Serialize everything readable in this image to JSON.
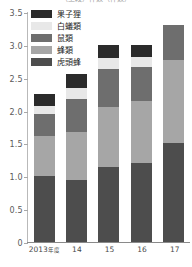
{
  "chart_data": {
    "type": "bar",
    "subtype": "stacked-vertical",
    "title": "（上段）件数（件数）",
    "title_clipped": true,
    "xlabel": "",
    "ylabel": "",
    "categories": [
      "2013年度",
      "14",
      "15",
      "16",
      "17"
    ],
    "ylim": [
      0,
      3.5
    ],
    "ytick_values": [
      0,
      0.5,
      1.0,
      1.5,
      2.0,
      2.5,
      3.0,
      3.5
    ],
    "ytick_labels": [
      "0",
      "0.5",
      "1.0",
      "1.5",
      "2.0",
      "2.5",
      "3.0",
      "3.5"
    ],
    "grid": false,
    "legend_position": "top-left",
    "stack_order_bottom_to_top": [
      "虎頭蜂",
      "蜂類",
      "鼠類",
      "白蟻類",
      "果子狸"
    ],
    "series": [
      {
        "name": "果子狸",
        "color": "#2b2b2b",
        "values": [
          0.18,
          0.2,
          0.2,
          0.18,
          0.0
        ]
      },
      {
        "name": "白蟻類",
        "color": "#e8e8e8",
        "values": [
          0.12,
          0.18,
          0.16,
          0.16,
          0.0
        ]
      },
      {
        "name": "鼠類",
        "color": "#6e6e6e",
        "values": [
          0.33,
          0.49,
          0.58,
          0.52,
          0.53
        ]
      },
      {
        "name": "蜂類",
        "color": "#a6a6a6",
        "values": [
          0.62,
          0.73,
          0.92,
          0.94,
          1.27
        ]
      },
      {
        "name": "虎頭蜂",
        "color": "#4d4d4d",
        "values": [
          1.0,
          0.95,
          1.14,
          1.2,
          1.5
        ]
      }
    ],
    "totals": [
      2.25,
      2.55,
      3.0,
      3.0,
      3.3
    ]
  },
  "legend": {
    "items": [
      {
        "label": "果子狸"
      },
      {
        "label": "白蟻類"
      },
      {
        "label": "鼠類"
      },
      {
        "label": "蜂類"
      },
      {
        "label": "虎頭蜂"
      }
    ]
  }
}
